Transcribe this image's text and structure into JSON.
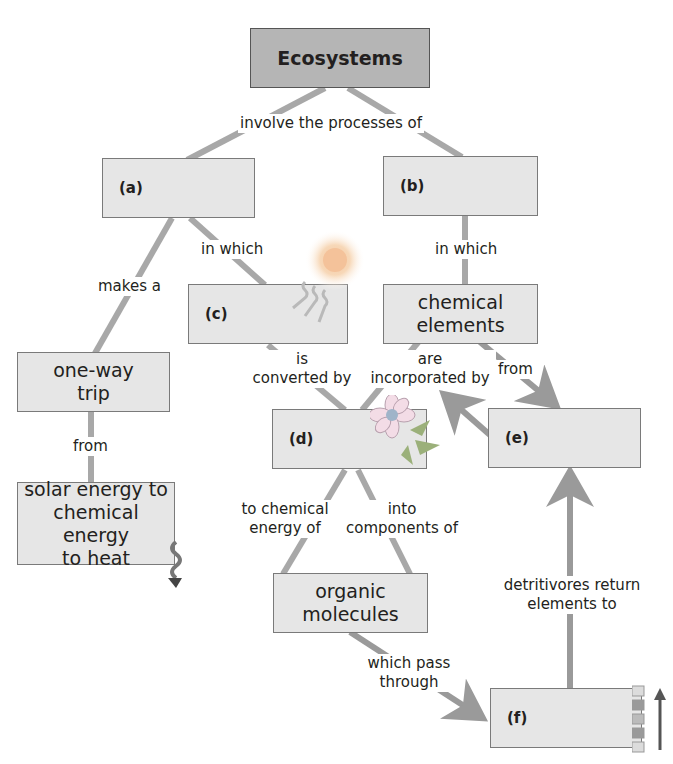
{
  "title": "Ecosystems",
  "colors": {
    "box_fill": "#e6e6e6",
    "root_fill": "#b5b5b5",
    "connector": "#a8a8a8",
    "arrow": "#9a9a9a"
  },
  "nodes": {
    "root": {
      "label": "Ecosystems"
    },
    "a": {
      "label": "(a)"
    },
    "b": {
      "label": "(b)"
    },
    "c": {
      "label": "(c)"
    },
    "d": {
      "label": "(d)"
    },
    "e": {
      "label": "(e)"
    },
    "f": {
      "label": "(f)"
    },
    "one_way_trip": {
      "line1": "one-way",
      "line2": "trip"
    },
    "solar_energy": {
      "line1": "solar energy to",
      "line2": "chemical energy",
      "line3": "to heat"
    },
    "chemical_elements": {
      "line1": "chemical",
      "line2": "elements"
    },
    "organic_molecules": {
      "line1": "organic",
      "line2": "molecules"
    }
  },
  "links": {
    "involve": "involve the processes of",
    "makes_a": "makes a",
    "in_which_a": "in which",
    "in_which_b": "in which",
    "from_trip": "from",
    "is_converted": {
      "line1": "is",
      "line2": "converted by"
    },
    "incorporated": {
      "line1": "are",
      "line2": "incorporated by"
    },
    "from_elements": "from",
    "to_chemical": {
      "line1": "to chemical",
      "line2": "energy of"
    },
    "into_components": {
      "line1": "into",
      "line2": "components of"
    },
    "which_pass": {
      "line1": "which pass",
      "line2": "through"
    },
    "detritivores": {
      "line1": "detritivores return",
      "line2": "elements to"
    }
  },
  "icons": [
    "sun-icon",
    "light-rays-icon",
    "flower-icon",
    "heat-wave-icon",
    "trophic-levels-icon"
  ]
}
